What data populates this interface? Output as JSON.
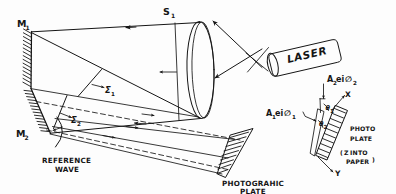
{
  "figure": {
    "ink_color": "#151515",
    "background_color": "#fdfdfd"
  },
  "labels": {
    "mirror_1": "M",
    "mirror_1_sub": "1",
    "mirror_2": "M",
    "mirror_2_sub": "2",
    "lens_s1": "S",
    "lens_s1_sub": "1",
    "wavefront_1": "Σ",
    "wavefront_1_sub": "1",
    "wavefront_2": "Σ",
    "wavefront_2_sub": "2",
    "laser": "LASER",
    "reference_wave_line1": "REFERENCE",
    "reference_wave_line2": "WAVE",
    "photographic_plate_line1": "PHOTOGRAHIC",
    "photographic_plate_line2": "PLATE",
    "photo_plate_line1": "PHOTO",
    "photo_plate_line2": "PLATE",
    "z_into_paper_open": "(",
    "z_into_paper_z": "Z",
    "z_into_paper_into": "INTO",
    "z_into_paper_paper": "PAPER",
    "z_into_paper_close": ")",
    "axis_x": "X",
    "axis_y": "Y",
    "theta_1": "θ",
    "theta_1_sub": "1",
    "theta_2": "θ",
    "theta_2_sub": "2"
  },
  "amplitudes": {
    "amplitude_1_main": "A",
    "amplitude_1_sub": "1",
    "amplitude_1_exp": "e",
    "amplitude_1_i": "i",
    "amplitude_1_phi": "∅",
    "amplitude_1_phi_sub": "1",
    "amplitude_2_main": "A",
    "amplitude_2_sub": "2",
    "amplitude_2_exp": "e",
    "amplitude_2_i": "i",
    "amplitude_2_phi": "∅",
    "amplitude_2_phi_sub": "2"
  },
  "components": [
    {
      "name": "mirror-m1",
      "kind": "plane-mirror",
      "orientation": "vertical",
      "label": "M1"
    },
    {
      "name": "mirror-m2",
      "kind": "plane-mirror",
      "orientation": "tilted",
      "label": "M2"
    },
    {
      "name": "lens-s1",
      "kind": "converging-lens",
      "orientation": "vertical",
      "label": "S1"
    },
    {
      "name": "laser-source",
      "kind": "laser-cylinder",
      "orientation": "tilted",
      "label": "LASER"
    },
    {
      "name": "photographic-plate",
      "kind": "hatched-plate",
      "orientation": "diagonal",
      "label": "PHOTOGRAHIC PLATE"
    },
    {
      "name": "photo-plate-inset",
      "kind": "hatched-plate",
      "orientation": "diagonal",
      "label": "PHOTO PLATE"
    },
    {
      "name": "reference-wavefront",
      "kind": "arc-wavefront",
      "orientation": "curved",
      "label": "REFERENCE WAVE"
    },
    {
      "name": "wavefront-sigma-1",
      "kind": "wavefront-line",
      "orientation": "diagonal",
      "label": "Σ1"
    },
    {
      "name": "wavefront-sigma-2",
      "kind": "wavefront-line",
      "orientation": "diagonal",
      "label": "Σ2"
    }
  ]
}
